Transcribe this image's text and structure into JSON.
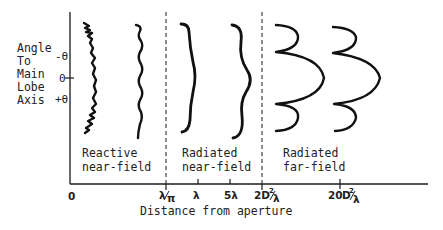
{
  "figure": {
    "y_axis_label_lines": [
      "Angle",
      "To",
      "Main",
      "Lobe",
      "Axis"
    ],
    "y_ticks": {
      "minus_theta": "-θ",
      "zero": "0",
      "plus_theta": "+θ"
    },
    "x_axis_label": "Distance from aperture",
    "x_ticks": {
      "origin": "0",
      "lambda_over_pi": {
        "num": "λ",
        "den": "π"
      },
      "lambda": "λ",
      "five_lambda": "5λ",
      "two_d2_over_lambda": {
        "prefix": "2D",
        "sup": "2",
        "den": "λ"
      },
      "twenty_d2_over_lambda": {
        "prefix": "20",
        "d": "D",
        "sup": "2",
        "den": "λ"
      }
    },
    "regions": [
      {
        "id": "reactive-near-field",
        "line1": "Reactive",
        "line2": "near-field"
      },
      {
        "id": "radiated-near-field",
        "line1": "Radiated",
        "line2": "near-field"
      },
      {
        "id": "radiated-far-field",
        "line1": "Radiated",
        "line2": "far-field"
      }
    ],
    "colors": {
      "ink": "#1a1a1a",
      "background": "#ffffff"
    }
  }
}
